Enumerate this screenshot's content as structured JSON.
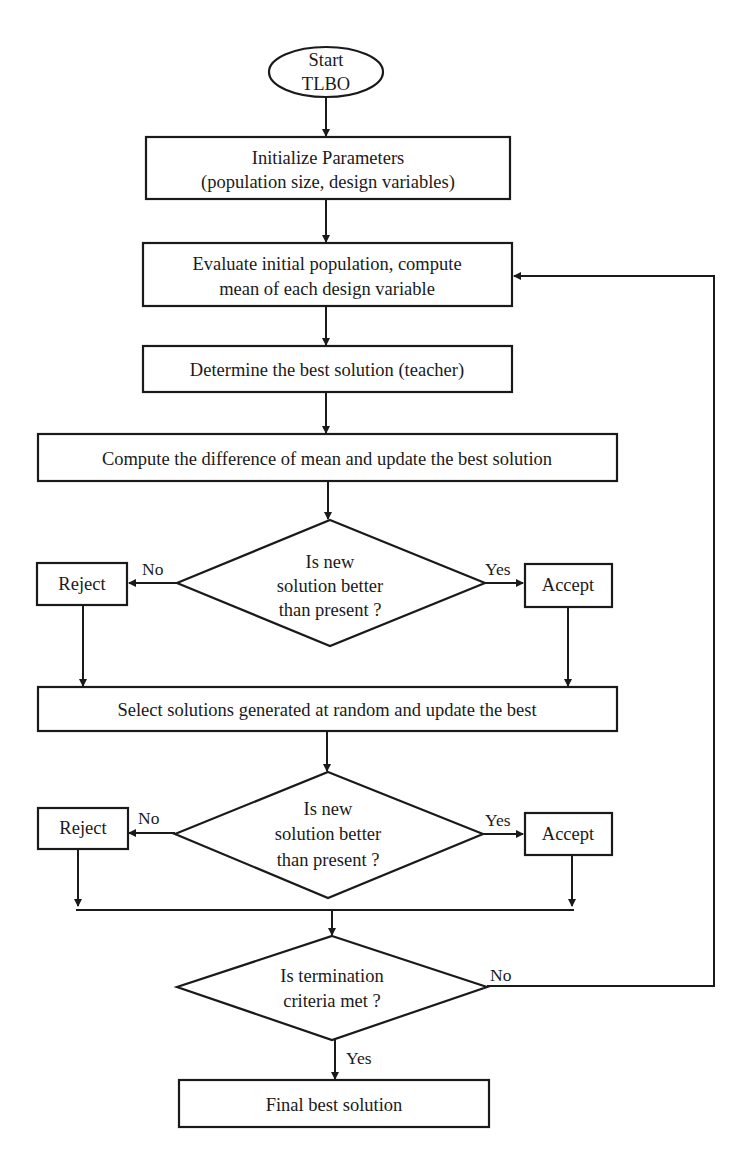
{
  "diagram": {
    "type": "flowchart",
    "nodes": {
      "start": {
        "line1": "Start",
        "line2": "TLBO"
      },
      "init": {
        "line1": "Initialize Parameters",
        "line2": "(population size, design variables)"
      },
      "evaluate": {
        "line1": "Evaluate initial population, compute",
        "line2": "mean of each design variable"
      },
      "teacher": {
        "line1": "Determine the best solution (teacher)"
      },
      "difference": {
        "line1": "Compute the difference of mean and update the best solution"
      },
      "decision1": {
        "line1": "Is new",
        "line2": "solution better",
        "line3": "than present ?"
      },
      "reject1": {
        "label": "Reject"
      },
      "accept1": {
        "label": "Accept"
      },
      "select": {
        "line1": "Select solutions generated at random and update the best"
      },
      "decision2": {
        "line1": "Is new",
        "line2": "solution better",
        "line3": "than present ?"
      },
      "reject2": {
        "label": "Reject"
      },
      "accept2": {
        "label": "Accept"
      },
      "termination": {
        "line1": "Is termination",
        "line2": "criteria met ?"
      },
      "final": {
        "line1": "Final best solution"
      }
    },
    "edge_labels": {
      "d1_no": "No",
      "d1_yes": "Yes",
      "d2_no": "No",
      "d2_yes": "Yes",
      "term_no": "No",
      "term_yes": "Yes"
    },
    "colors": {
      "stroke": "#1a1a1a",
      "background": "#ffffff"
    }
  }
}
